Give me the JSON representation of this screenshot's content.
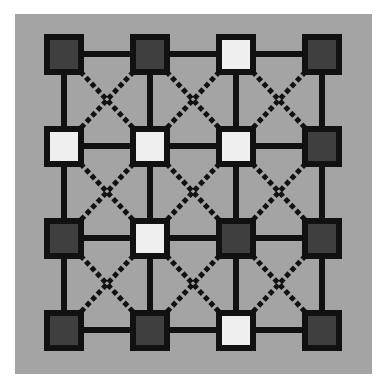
{
  "board": {
    "rows": 4,
    "cols": 4,
    "colors": {
      "background": "#a4a4a4",
      "line": "#111111",
      "dark": "#3f3f3f",
      "light": "#efefef"
    },
    "col_centers": [
      64,
      150,
      236,
      322
    ],
    "row_centers": [
      54,
      146,
      238,
      330
    ],
    "nodes": [
      [
        "dark",
        "dark",
        "light",
        "dark"
      ],
      [
        "light",
        "light",
        "light",
        "dark"
      ],
      [
        "dark",
        "light",
        "dark",
        "dark"
      ],
      [
        "dark",
        "dark",
        "light",
        "dark"
      ]
    ]
  }
}
